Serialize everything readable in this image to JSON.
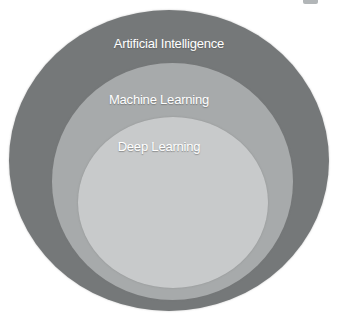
{
  "diagram": {
    "type": "nested-concentric-venn",
    "rings": [
      {
        "id": "artificial-intelligence",
        "label": "Artificial Intelligence",
        "color": "#757879",
        "level": "outer"
      },
      {
        "id": "machine-learning",
        "label": "Machine Learning",
        "color": "#a7aaab",
        "level": "middle"
      },
      {
        "id": "deep-learning",
        "label": "Deep Learning",
        "color": "#c8cacb",
        "level": "inner"
      }
    ]
  },
  "colors": {
    "background": "#ffffff",
    "label_text": "#ffffff",
    "corner_artifact": "#b2b6b8"
  }
}
